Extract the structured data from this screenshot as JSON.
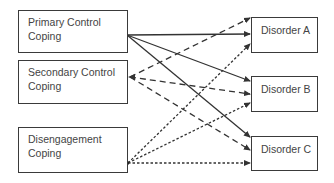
{
  "diagram": {
    "sources": [
      {
        "id": "primary",
        "line1": "Primary Control",
        "line2": "Coping"
      },
      {
        "id": "secondary",
        "line1": "Secondary Control",
        "line2": "Coping"
      },
      {
        "id": "disengagement",
        "line1": "Disengagement",
        "line2": "Coping"
      }
    ],
    "targets": [
      {
        "id": "a",
        "label": "Disorder A"
      },
      {
        "id": "b",
        "label": "Disorder B"
      },
      {
        "id": "c",
        "label": "Disorder C"
      }
    ],
    "edges": [
      {
        "from": "primary",
        "to": "a",
        "style": "solid"
      },
      {
        "from": "primary",
        "to": "b",
        "style": "solid"
      },
      {
        "from": "primary",
        "to": "c",
        "style": "solid"
      },
      {
        "from": "secondary",
        "to": "a",
        "style": "dashed"
      },
      {
        "from": "secondary",
        "to": "b",
        "style": "dashed"
      },
      {
        "from": "secondary",
        "to": "c",
        "style": "dashed"
      },
      {
        "from": "disengagement",
        "to": "a",
        "style": "dotted"
      },
      {
        "from": "disengagement",
        "to": "b",
        "style": "dotted"
      },
      {
        "from": "disengagement",
        "to": "c",
        "style": "dotted"
      }
    ],
    "colors": {
      "line": "#333333",
      "text": "#444444",
      "border": "#3a3a3a"
    }
  }
}
